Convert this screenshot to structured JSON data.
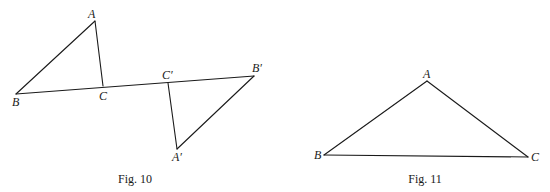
{
  "figures": [
    {
      "caption": "Fig. 10",
      "caption_pos": [
        135,
        183
      ],
      "points": {
        "A": {
          "label": "A",
          "x": 95,
          "y": 21,
          "lx": 88,
          "ly": 18
        },
        "B": {
          "label": "B",
          "x": 16,
          "y": 94,
          "lx": 12,
          "ly": 106
        },
        "C": {
          "label": "C",
          "x": 103,
          "y": 86,
          "lx": 99,
          "ly": 100
        },
        "Cp": {
          "label": "C′",
          "x": 168,
          "y": 83,
          "lx": 162,
          "ly": 79
        },
        "Bp": {
          "label": "B′",
          "x": 254,
          "y": 76,
          "lx": 252,
          "ly": 72
        },
        "Ap": {
          "label": "A′",
          "x": 177,
          "y": 149,
          "lx": 172,
          "ly": 161
        }
      },
      "segments": [
        [
          "A",
          "B"
        ],
        [
          "A",
          "C"
        ],
        [
          "B",
          "Bp"
        ],
        [
          "Cp",
          "Ap"
        ],
        [
          "Ap",
          "Bp"
        ]
      ]
    },
    {
      "caption": "Fig. 11",
      "caption_pos": [
        425,
        183
      ],
      "points": {
        "A": {
          "label": "A",
          "x": 427,
          "y": 81,
          "lx": 423,
          "ly": 78
        },
        "B": {
          "label": "B",
          "x": 324,
          "y": 155,
          "lx": 314,
          "ly": 159
        },
        "C": {
          "label": "C",
          "x": 528,
          "y": 157,
          "lx": 531,
          "ly": 161
        }
      },
      "segments": [
        [
          "A",
          "B"
        ],
        [
          "A",
          "C"
        ],
        [
          "B",
          "C"
        ]
      ]
    }
  ]
}
